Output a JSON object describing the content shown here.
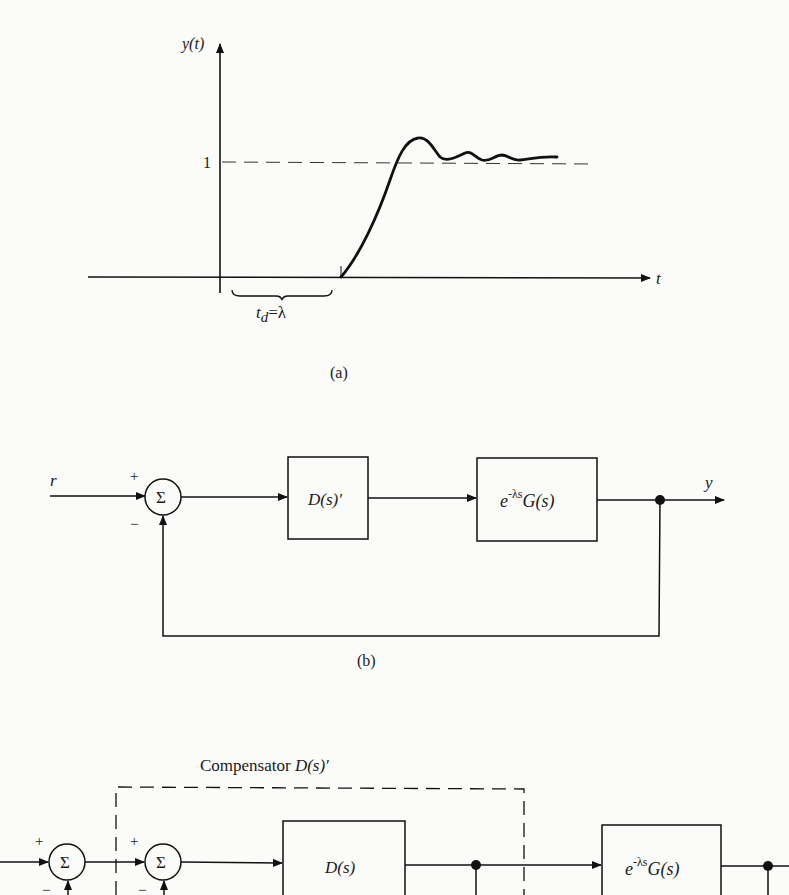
{
  "figure_a": {
    "caption": "(a)",
    "y_axis_label": "y(t)",
    "x_axis_label": "t",
    "reference_level_label": "1",
    "delay_label_t": "t",
    "delay_label_sub": "d",
    "delay_label_rest": "=λ",
    "curve": "step response with dead time: zero until t_d, then rises, overshoots above 1 and settles with small oscillations"
  },
  "figure_b": {
    "caption": "(b)",
    "input_label": "r",
    "output_label": "y",
    "summer": {
      "symbol": "Σ",
      "plus": "+",
      "minus": "−"
    },
    "block_controller": {
      "label": "D(s)′"
    },
    "block_plant": {
      "exp": "e",
      "exp_sup": "-λs",
      "label": "G(s)"
    }
  },
  "figure_c": {
    "compensator_title": "Compensator ",
    "compensator_title_math": "D(s)′",
    "summer1": {
      "symbol": "Σ",
      "plus": "+",
      "minus": "−"
    },
    "summer2": {
      "symbol": "Σ",
      "plus": "+",
      "minus": "−"
    },
    "block_controller": {
      "label": "D(s)"
    },
    "block_plant": {
      "exp": "e",
      "exp_sup": "-λs",
      "label": "G(s)"
    }
  }
}
